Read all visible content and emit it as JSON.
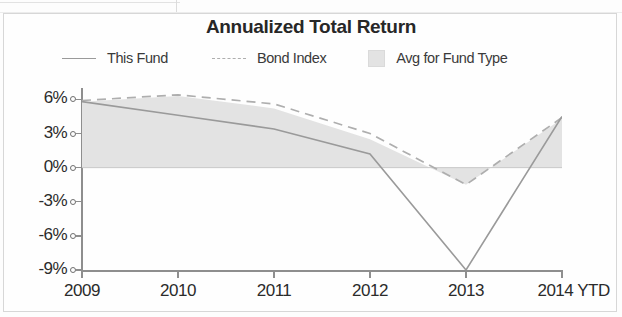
{
  "chart_data": {
    "type": "line",
    "title": "Annualized Total Return",
    "xlabel": "",
    "ylabel": "",
    "x": [
      "2009",
      "2010",
      "2011",
      "2012",
      "2013",
      "2014 YTD"
    ],
    "categories": [
      "2009",
      "2010",
      "2011",
      "2012",
      "2013",
      "2014 YTD"
    ],
    "ylim": [
      -9,
      7
    ],
    "ytick_values": [
      6,
      3,
      0,
      -3,
      -6,
      -9
    ],
    "ytick_labels": [
      "6%",
      "3%",
      "0%",
      "-3%",
      "-6%",
      "-9%"
    ],
    "grid": false,
    "legend_position": "top",
    "series": [
      {
        "name": "This Fund",
        "style": "solid",
        "color": "#9a9a9a",
        "values": [
          5.8,
          4.6,
          3.4,
          1.2,
          -9.0,
          4.5
        ]
      },
      {
        "name": "Bond Index",
        "style": "dashed",
        "color": "#aeaeae",
        "values": [
          5.9,
          6.4,
          5.6,
          3.0,
          -1.5,
          4.4
        ]
      },
      {
        "name": "Avg for Fund Type",
        "style": "area",
        "color": "#e3e3e3",
        "values": [
          5.8,
          6.3,
          5.2,
          2.5,
          -1.5,
          4.3
        ]
      }
    ]
  },
  "title": "Annualized Total Return",
  "legend": {
    "items": [
      {
        "label": "This Fund",
        "marker": "solid-line-swatch"
      },
      {
        "label": "Bond Index",
        "marker": "dashed-line-swatch"
      },
      {
        "label": "Avg for Fund Type",
        "marker": "filled-square-swatch"
      }
    ]
  },
  "y_axis": {
    "labels": [
      "6%",
      "3%",
      "0%",
      "-3%",
      "-6%",
      "-9%"
    ]
  },
  "x_axis": {
    "labels": [
      "2009",
      "2010",
      "2011",
      "2012",
      "2013",
      "2014 YTD"
    ]
  }
}
